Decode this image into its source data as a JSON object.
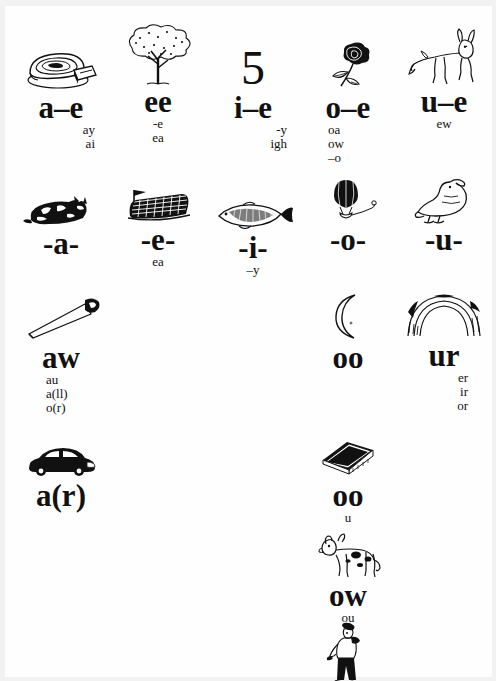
{
  "document": {
    "kind": "phonics-spelling-chart",
    "background_color": "#fefefe",
    "ink_color": "#111111"
  },
  "rows": [
    {
      "name": "long-vowel-split-digraphs",
      "cells": [
        {
          "grapheme": "a–e",
          "picture": "cake-slice",
          "alts": [
            "ay",
            "ai"
          ],
          "align": "right"
        },
        {
          "grapheme": "ee",
          "picture": "tree",
          "alts": [
            "-e",
            "ea"
          ],
          "align": "center"
        },
        {
          "grapheme": "i–e",
          "picture": "five",
          "alts": [
            "-y",
            "igh"
          ],
          "align": "right"
        },
        {
          "grapheme": "o–e",
          "picture": "rose",
          "alts": [
            "oa",
            "ow",
            "–o"
          ],
          "align": "left"
        },
        {
          "grapheme": "u–e",
          "picture": "mule",
          "alts": [
            "ew"
          ],
          "align": "center"
        }
      ]
    },
    {
      "name": "short-vowels",
      "cells": [
        {
          "grapheme": "-a-",
          "picture": "cat",
          "alts": [],
          "align": "center"
        },
        {
          "grapheme": "-e-",
          "picture": "bed",
          "alts": [
            "ea"
          ],
          "align": "center"
        },
        {
          "grapheme": "-i-",
          "picture": "fish",
          "alts": [
            "–y"
          ],
          "align": "center"
        },
        {
          "grapheme": "-o-",
          "picture": "balloon",
          "alts": [],
          "align": "center"
        },
        {
          "grapheme": "-u-",
          "picture": "duck",
          "alts": [],
          "align": "center"
        }
      ]
    },
    {
      "name": "other-vowel-sounds",
      "cells": [
        {
          "grapheme": "aw",
          "picture": "saw",
          "alts": [
            "au",
            "a(ll)",
            "o(r)"
          ],
          "align": "leftish"
        },
        {
          "grapheme": "oo",
          "picture": "moon",
          "alts": [],
          "align": "center"
        },
        {
          "grapheme": "ur",
          "picture": "rainbow",
          "alts": [
            "er",
            "ir",
            "or"
          ],
          "align": "rightish"
        }
      ]
    },
    {
      "name": "r-controlled-and-short-oo",
      "cells": [
        {
          "grapheme": "a(r)",
          "picture": "car",
          "alts": [],
          "align": "center"
        },
        {
          "grapheme": "oo",
          "picture": "book",
          "alts": [
            "u"
          ],
          "align": "center"
        }
      ]
    },
    {
      "name": "ow-diphthong",
      "cells": [
        {
          "grapheme": "ow",
          "picture": "cow",
          "alts": [
            "ou"
          ],
          "align": "center"
        }
      ]
    },
    {
      "name": "unlabelled-figure",
      "cells": [
        {
          "grapheme": "",
          "picture": "boy",
          "alts": [],
          "align": "center"
        }
      ]
    }
  ]
}
